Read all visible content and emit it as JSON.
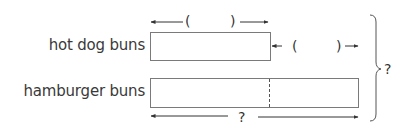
{
  "diagram": {
    "type": "tape-diagram",
    "rows": [
      {
        "id": "hot-dog",
        "label": "hot dog buns",
        "top_length_label": {
          "open": "(",
          "blank": "",
          "close": ")"
        },
        "difference_label": {
          "open": "(",
          "blank": "",
          "close": ")"
        }
      },
      {
        "id": "hamburger",
        "label": "hamburger buns",
        "has_divider": true,
        "bottom_length_label": "?"
      }
    ],
    "total_label": "?",
    "colors": {
      "bar_border": "#7a7a7a",
      "text": "#3a3a3a",
      "arrow": "#333333"
    }
  }
}
